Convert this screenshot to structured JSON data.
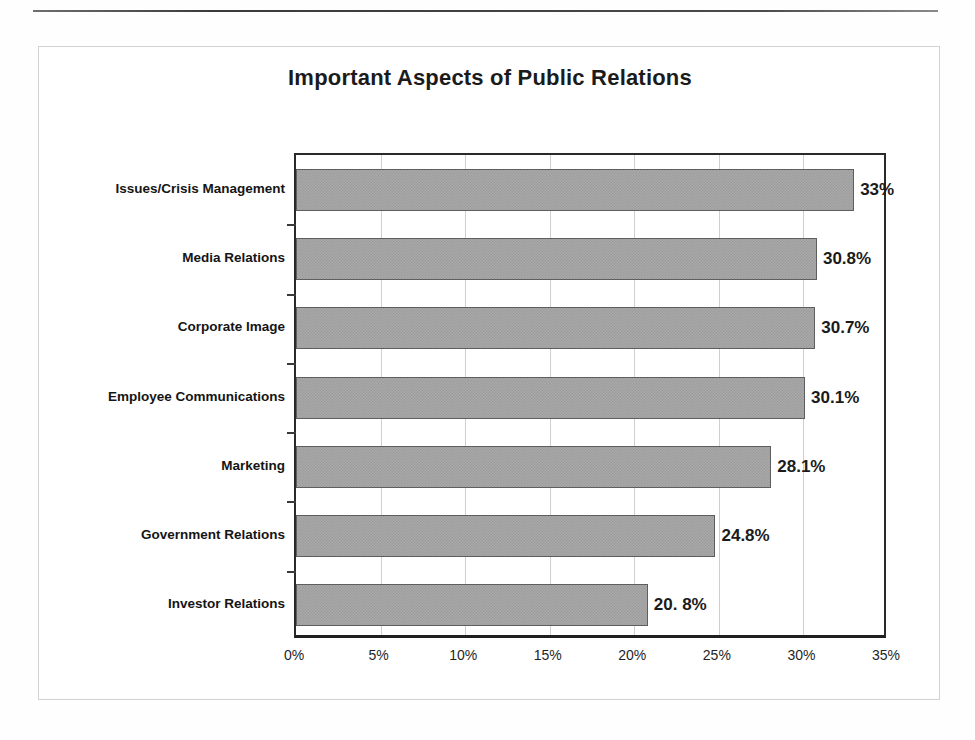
{
  "chart_data": {
    "type": "bar",
    "orientation": "horizontal",
    "title": "Important Aspects of Public Relations",
    "xlabel": "",
    "ylabel": "",
    "xlim": [
      0,
      35
    ],
    "grid": true,
    "legend": "none",
    "categories": [
      "Issues/Crisis Management",
      "Media Relations",
      "Corporate Image",
      "Employee Communications",
      "Marketing",
      "Government Relations",
      "Investor Relations"
    ],
    "values": [
      33,
      30.8,
      30.7,
      30.1,
      28.1,
      24.8,
      20.8
    ],
    "value_labels": [
      "33%",
      "30.8%",
      "30.7%",
      "30.1%",
      "28.1%",
      "24.8%",
      "20. 8%"
    ],
    "xticks": [
      0,
      5,
      10,
      15,
      20,
      25,
      30,
      35
    ],
    "xtick_labels": [
      "0%",
      "5%",
      "10%",
      "15%",
      "20%",
      "25%",
      "30%",
      "35%"
    ]
  },
  "colors": {
    "bar_fill": "#a9a9a9",
    "bar_border": "#5e5e5e",
    "axis": "#2a2a2a",
    "gridline": "#cfcfcf",
    "text": "#1b1b1b",
    "page_background": "#ffffff"
  }
}
